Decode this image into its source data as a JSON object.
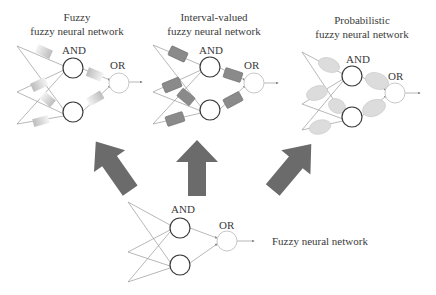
{
  "panels": {
    "fuzzy_fnn": {
      "title_line1": "Fuzzy",
      "title_line2": "fuzzy neural network",
      "and_label": "AND",
      "or_label": "OR",
      "weight_style": "faded-gradient-rectangles"
    },
    "interval_fnn": {
      "title_line1": "Interval-valued",
      "title_line2": "fuzzy neural network",
      "and_label": "AND",
      "or_label": "OR",
      "weight_style": "gray-rectangles"
    },
    "probabilistic_fnn": {
      "title_line1": "Probabilistic",
      "title_line2": "fuzzy neural network",
      "and_label": "AND",
      "or_label": "OR",
      "weight_style": "light-gray-ellipses"
    },
    "base_fnn": {
      "label": "Fuzzy neural network",
      "and_label": "AND",
      "or_label": "OR"
    }
  },
  "arrows": [
    {
      "name": "arrow-to-fuzzy",
      "direction": "up-left"
    },
    {
      "name": "arrow-to-interval",
      "direction": "up"
    },
    {
      "name": "arrow-to-probabilistic",
      "direction": "up-right"
    }
  ],
  "colors": {
    "arrow": "#6b6b6b",
    "and_node": "#3a3a3a",
    "or_node": "#c8c8c8",
    "connection": "#999999",
    "interval_weight": "#8a8a8a",
    "probabilistic_weight": "#dcdcdc",
    "fuzzy_weight": "#c4c4c4"
  }
}
